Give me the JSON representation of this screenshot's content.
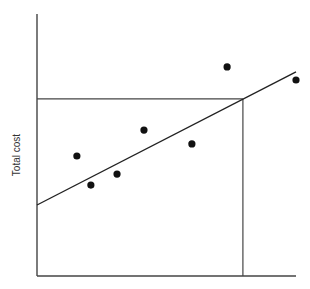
{
  "chart_data": {
    "type": "scatter",
    "title": "",
    "xlabel": "",
    "ylabel": "Total cost",
    "grid": false,
    "legend": null,
    "xlim": [
      0,
      100
    ],
    "ylim": [
      0,
      100
    ],
    "points": [
      {
        "x": 15.4,
        "y": 45.8
      },
      {
        "x": 20.8,
        "y": 34.7
      },
      {
        "x": 30.9,
        "y": 38.9
      },
      {
        "x": 41.3,
        "y": 55.7
      },
      {
        "x": 59.8,
        "y": 50.4
      },
      {
        "x": 73.4,
        "y": 79.8
      },
      {
        "x": 100.0,
        "y": 74.8
      }
    ],
    "regression_line": {
      "x0": 0,
      "y0": 27.1,
      "x1": 100,
      "y1": 77.9
    },
    "reference_lines": {
      "horizontal": {
        "y": 67.6,
        "x_from": 0,
        "x_to": 79.5
      },
      "vertical": {
        "x": 79.5,
        "y_from": 0,
        "y_to": 67.6
      }
    },
    "colors": {
      "axis": "#444444",
      "points": "#111111",
      "line": "#222222"
    }
  },
  "labels": {
    "ylabel": "Total cost"
  }
}
